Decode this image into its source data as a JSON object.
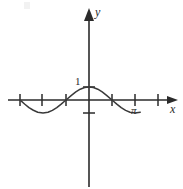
{
  "figure": {
    "title": "",
    "background_color": "#ffffff",
    "ink_color": "#2b2b2b",
    "curve_color": "#3a3a3a"
  },
  "labels": {
    "y_axis": "y",
    "x_axis": "x",
    "y_one": "1",
    "x_pi": "π"
  },
  "chart_data": {
    "type": "line",
    "title": "",
    "subtitle": "",
    "xlabel": "x",
    "ylabel": "y",
    "function": "y = cos(x)",
    "grid": false,
    "legend": null,
    "xlim": [
      -3.14159,
      3.6
    ],
    "ylim": [
      -1.6,
      2.6
    ],
    "x_ticks": [
      -3.14159,
      -1.5708,
      1.5708,
      3.14159
    ],
    "x_tick_labels": [
      "",
      "",
      "",
      "π"
    ],
    "y_ticks": [
      -1,
      1
    ],
    "y_tick_labels": [
      "",
      "1"
    ],
    "annotations": [
      {
        "text": "1",
        "x": 0,
        "y": 1,
        "position": "left-of-peak"
      },
      {
        "text": "π",
        "x": 3.14159,
        "y": -0.28,
        "position": "below-axis"
      }
    ],
    "series": [
      {
        "name": "cos(x)",
        "x": [
          -4.7,
          -4.4,
          -4.1,
          -3.8,
          -3.5,
          -3.14159,
          -2.8,
          -2.5,
          -2.2,
          -1.9,
          -1.5708,
          -1.2,
          -0.9,
          -0.6,
          -0.3,
          0,
          0.3,
          0.6,
          0.9,
          1.2,
          1.5708,
          1.9,
          2.2,
          2.5,
          2.8,
          3.14159,
          3.5
        ],
        "values": [
          -0.01,
          -0.31,
          -0.59,
          -0.79,
          -0.94,
          -1,
          -0.94,
          -0.8,
          -0.59,
          -0.32,
          0,
          0.36,
          0.62,
          0.83,
          0.96,
          1,
          0.96,
          0.83,
          0.62,
          0.36,
          0,
          -0.32,
          -0.59,
          -0.8,
          -0.94,
          -1,
          -0.94
        ]
      }
    ]
  }
}
